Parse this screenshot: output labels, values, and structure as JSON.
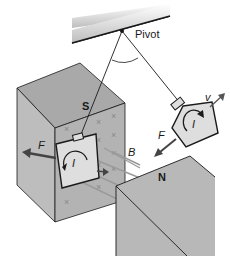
{
  "diagram": {
    "type": "physics-illustration",
    "labels": {
      "pivot": "Pivot",
      "south_pole": "S",
      "north_pole": "N",
      "magnetic_field": "B",
      "force_left": "F",
      "force_right": "F",
      "velocity": "v",
      "current_left": "I",
      "current_right": "I"
    },
    "field_marks": [
      "×",
      "×",
      "×",
      "×",
      "×",
      "×",
      "×",
      "×",
      "×",
      "×",
      "×",
      "×"
    ],
    "colors": {
      "magnet_face": "#b8b8b8",
      "magnet_top": "#a8a8a8",
      "magnet_side": "#c4c4c4",
      "plate": "#dedede",
      "line": "#1a1a1a",
      "field_line": "#9a9a9a",
      "ceiling_shade": "#cfcfcf"
    }
  }
}
